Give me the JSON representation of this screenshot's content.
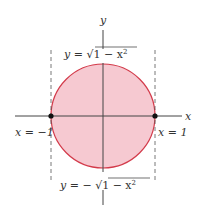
{
  "diagram": {
    "colors": {
      "fill": "#f6c9d1",
      "stroke": "#d33a4a",
      "axis": "#444444",
      "dashed": "#555555",
      "text": "#333333",
      "point": "#111111"
    },
    "axes": {
      "x_label": "x",
      "y_label": "y"
    },
    "labels": {
      "top_curve_lhs": "y = ",
      "top_curve_sqrt": "√",
      "top_curve_radicand": "1 − x",
      "top_curve_exp": "2",
      "bottom_curve_lhs": "y = − ",
      "bottom_curve_sqrt": "√",
      "bottom_curve_radicand": "1 − x",
      "bottom_curve_exp": "2",
      "left_bound": "x = −1",
      "right_bound": "x = 1"
    },
    "points": [
      {
        "name": "left-intersection",
        "x": -1,
        "y": 0
      },
      {
        "name": "right-intersection",
        "x": 1,
        "y": 0
      }
    ]
  }
}
